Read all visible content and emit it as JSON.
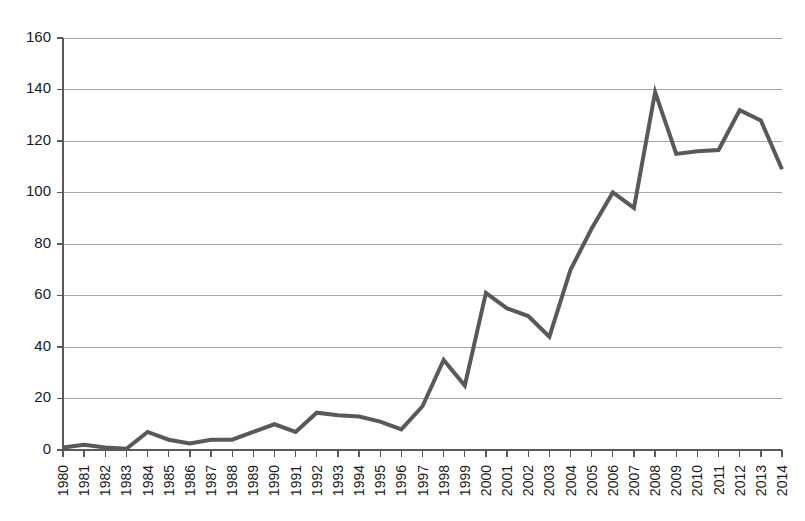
{
  "chart_data": {
    "type": "line",
    "title": "",
    "subtitle": "",
    "xlabel": "",
    "ylabel": "",
    "grid": true,
    "legend": false,
    "legend_position": "none",
    "line_color": "#595959",
    "gridline_color": "#a6a6a6",
    "axis_color": "#595959",
    "xlim": [
      1980,
      2014
    ],
    "ylim": [
      0,
      160
    ],
    "ytick_step": 20,
    "yticks": [
      0,
      20,
      40,
      60,
      80,
      100,
      120,
      140,
      160
    ],
    "ytick_labels": [
      "0",
      "20",
      "40",
      "60",
      "80",
      "100",
      "120",
      "140",
      "160"
    ],
    "categories": [
      "1980",
      "1981",
      "1982",
      "1983",
      "1984",
      "1985",
      "1986",
      "1987",
      "1988",
      "1989",
      "1990",
      "1991",
      "1992",
      "1993",
      "1994",
      "1995",
      "1996",
      "1997",
      "1998",
      "1999",
      "2000",
      "2001",
      "2002",
      "2003",
      "2004",
      "2005",
      "2006",
      "2007",
      "2008",
      "2009",
      "2010",
      "2011",
      "2012",
      "2013",
      "2014"
    ],
    "series": [
      {
        "name": "",
        "values": [
          1,
          2,
          1,
          0.5,
          7,
          4,
          2.5,
          4,
          4,
          7,
          10,
          7,
          14.5,
          13.5,
          13,
          11,
          8,
          17,
          35,
          25,
          61,
          55,
          52,
          44,
          70,
          86,
          100,
          94,
          139,
          115,
          116,
          116.5,
          132,
          128,
          109
        ]
      }
    ]
  }
}
